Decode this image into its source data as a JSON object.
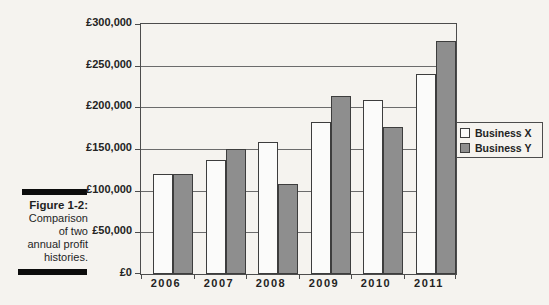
{
  "figure_caption": {
    "label": "Figure 1-2:",
    "lines": [
      "Comparison",
      "of two",
      "annual profit",
      "histories."
    ]
  },
  "legend": {
    "items": [
      {
        "label": "Business X",
        "color": "#fbfbfa"
      },
      {
        "label": "Business Y",
        "color": "#8e8e8e"
      }
    ]
  },
  "chart_data": {
    "type": "bar",
    "title": "",
    "xlabel": "",
    "ylabel": "",
    "categories": [
      "2006",
      "2007",
      "2008",
      "2009",
      "2010",
      "2011"
    ],
    "series": [
      {
        "name": "Business X",
        "color": "#fbfbfa",
        "values": [
          120000,
          137000,
          158000,
          182000,
          209000,
          240000
        ]
      },
      {
        "name": "Business Y",
        "color": "#8e8e8e",
        "values": [
          120000,
          150000,
          108000,
          214000,
          176000,
          280000
        ]
      }
    ],
    "ylim": [
      0,
      300000
    ],
    "ytick_step": 50000,
    "ylabel_ticks": [
      "£0",
      "£50,000",
      "£100,000",
      "£150,000",
      "£200,000",
      "£250,000",
      "£300,000"
    ],
    "currency": "£",
    "grid": true,
    "legend_position": "right"
  }
}
